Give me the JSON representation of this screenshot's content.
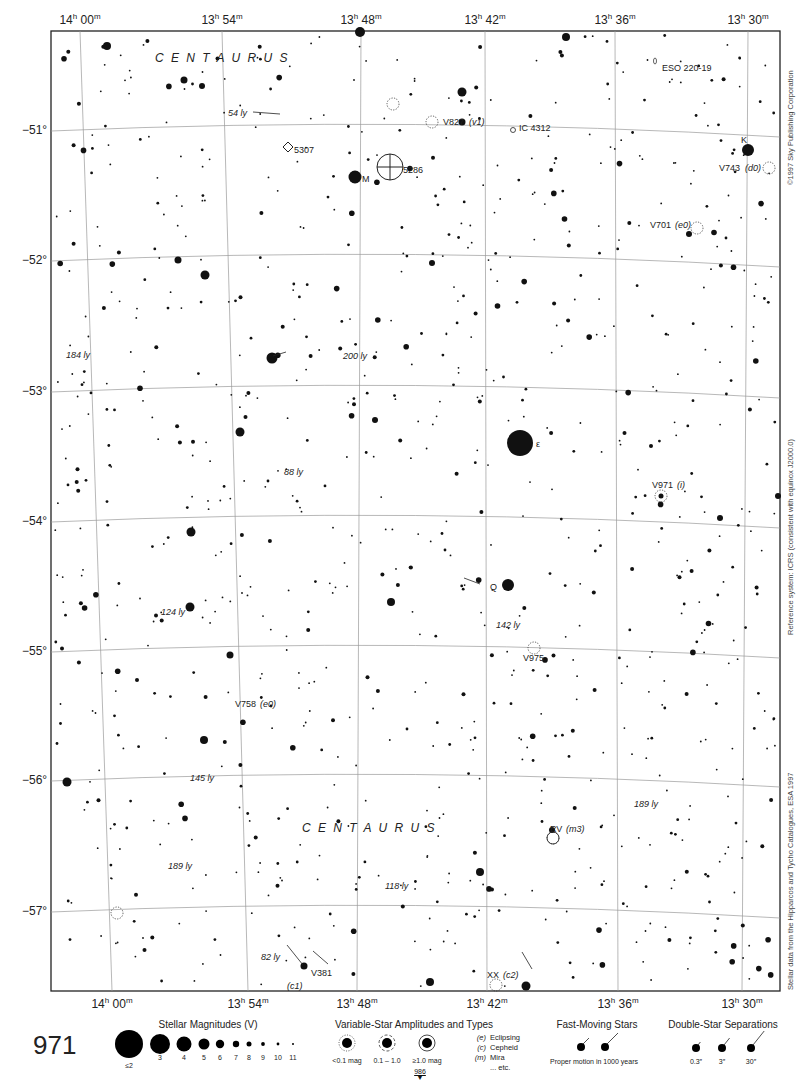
{
  "page": {
    "number": "971",
    "next_page": "986"
  },
  "ra_labels_top": [
    "14h 00m",
    "13h 54m",
    "13h 48m",
    "13h 42m",
    "13h 36m",
    "13h 30m"
  ],
  "ra_ticks": [
    {
      "h": "14",
      "m": "00",
      "top_x": 80,
      "bot_x": 112
    },
    {
      "h": "13",
      "m": "54",
      "top_x": 222,
      "bot_x": 248
    },
    {
      "h": "13",
      "m": "48",
      "top_x": 361,
      "bot_x": 357
    },
    {
      "h": "13",
      "m": "42",
      "top_x": 485,
      "bot_x": 487
    },
    {
      "h": "13",
      "m": "36",
      "top_x": 615,
      "bot_x": 618
    },
    {
      "h": "13",
      "m": "30",
      "top_x": 748,
      "bot_x": 742
    }
  ],
  "dec_labels": [
    {
      "label": "−51°",
      "y": 131
    },
    {
      "label": "−52°",
      "y": 261
    },
    {
      "label": "−53°",
      "y": 392
    },
    {
      "label": "−54°",
      "y": 522
    },
    {
      "label": "−55°",
      "y": 652
    },
    {
      "label": "−56°",
      "y": 781
    },
    {
      "label": "−57°",
      "y": 912
    }
  ],
  "side_credits": {
    "copyright": "©1997 Sky Publishing Corporation",
    "reference": "Reference system: ICRS (consistent with equinox J2000.0)",
    "data_source": "Stellar data from the Hipparcos and Tycho Catalogues, ESA 1997"
  },
  "constellation_labels": [
    {
      "text": "C E N T A U R U S",
      "x": 155,
      "y": 62
    },
    {
      "text": "C E N T A U R U S",
      "x": 302,
      "y": 832
    }
  ],
  "labels": [
    {
      "text": "ESO 220-19",
      "x": 662,
      "y": 71,
      "italic": false
    },
    {
      "text": "54 ly",
      "x": 228,
      "y": 116,
      "italic": true
    },
    {
      "text": "V827",
      "x": 443,
      "y": 125,
      "italic": false
    },
    {
      "text": "(v1)",
      "x": 469,
      "y": 125,
      "italic": true
    },
    {
      "text": "IC 4312",
      "x": 519,
      "y": 131,
      "italic": false
    },
    {
      "text": "K",
      "x": 741,
      "y": 143,
      "italic": false
    },
    {
      "text": "5307",
      "x": 294,
      "y": 153,
      "italic": false
    },
    {
      "text": "5286",
      "x": 403,
      "y": 173,
      "italic": false
    },
    {
      "text": "M",
      "x": 362,
      "y": 182,
      "italic": false
    },
    {
      "text": "V743",
      "x": 719,
      "y": 171,
      "italic": false
    },
    {
      "text": "(d0)",
      "x": 745,
      "y": 171,
      "italic": true
    },
    {
      "text": "V701",
      "x": 650,
      "y": 228,
      "italic": false
    },
    {
      "text": "(e0)",
      "x": 675,
      "y": 228,
      "italic": true
    },
    {
      "text": "184 ly",
      "x": 66,
      "y": 358,
      "italic": true
    },
    {
      "text": "200 ly",
      "x": 343,
      "y": 359,
      "italic": true
    },
    {
      "text": "ε",
      "x": 536,
      "y": 447,
      "italic": false
    },
    {
      "text": "V971",
      "x": 652,
      "y": 488,
      "italic": false
    },
    {
      "text": "(i)",
      "x": 677,
      "y": 488,
      "italic": true
    },
    {
      "text": "88 ly",
      "x": 284,
      "y": 475,
      "italic": true
    },
    {
      "text": "Q",
      "x": 490,
      "y": 590,
      "italic": false
    },
    {
      "text": "124 ly",
      "x": 161,
      "y": 615,
      "italic": true
    },
    {
      "text": "142 ly",
      "x": 496,
      "y": 628,
      "italic": true
    },
    {
      "text": "V975",
      "x": 523,
      "y": 661,
      "italic": false
    },
    {
      "text": "V758",
      "x": 235,
      "y": 707,
      "italic": false
    },
    {
      "text": "(e0)",
      "x": 260,
      "y": 707,
      "italic": true
    },
    {
      "text": "145 ly",
      "x": 190,
      "y": 781,
      "italic": true
    },
    {
      "text": "189 ly",
      "x": 634,
      "y": 807,
      "italic": true
    },
    {
      "text": "RV",
      "x": 550,
      "y": 832,
      "italic": false
    },
    {
      "text": "(m3)",
      "x": 566,
      "y": 832,
      "italic": true
    },
    {
      "text": "189 ly",
      "x": 168,
      "y": 869,
      "italic": true
    },
    {
      "text": "118 ly",
      "x": 385,
      "y": 889,
      "italic": true
    },
    {
      "text": "82 ly",
      "x": 261,
      "y": 960,
      "italic": true
    },
    {
      "text": "V381",
      "x": 311,
      "y": 976,
      "italic": false
    },
    {
      "text": "(c1)",
      "x": 287,
      "y": 989,
      "italic": true
    },
    {
      "text": "XX",
      "x": 487,
      "y": 978,
      "italic": false
    },
    {
      "text": "(c2)",
      "x": 503,
      "y": 978,
      "italic": true
    }
  ],
  "legend": {
    "magnitudes": {
      "title": "Stellar Magnitudes (V)",
      "items": [
        "≤2",
        "3",
        "4",
        "5",
        "6",
        "7",
        "8",
        "9",
        "10",
        "11"
      ]
    },
    "variables": {
      "title": "Variable-Star Amplitudes and Types",
      "amplitudes": [
        "<0.1 mag",
        "0.1 – 1.0",
        "≥1.0 mag"
      ],
      "types": [
        {
          "code": "(e)",
          "name": "Eclipsing"
        },
        {
          "code": "(c)",
          "name": "Cepheid"
        },
        {
          "code": "(m)",
          "name": "Mira"
        },
        {
          "code": "",
          "name": "... etc."
        }
      ]
    },
    "fast_moving": {
      "title": "Fast-Moving Stars",
      "caption": "Proper motion in 1000 years"
    },
    "double_stars": {
      "title": "Double-Star Separations",
      "items": [
        "0.3″",
        "3″",
        "30″"
      ]
    }
  }
}
